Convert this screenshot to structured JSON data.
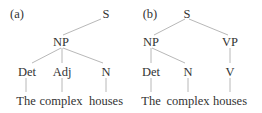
{
  "figure": {
    "panels": [
      {
        "label": "(a)",
        "nodes": {
          "S": "S",
          "NP": "NP",
          "Det": "Det",
          "Adj": "Adj",
          "N": "N"
        },
        "words": [
          "The",
          "complex",
          "houses"
        ]
      },
      {
        "label": "(b)",
        "nodes": {
          "S": "S",
          "NP": "NP",
          "VP": "VP",
          "Det": "Det",
          "N": "N",
          "V": "V"
        },
        "words": [
          "The",
          "complex",
          "houses"
        ]
      }
    ]
  }
}
